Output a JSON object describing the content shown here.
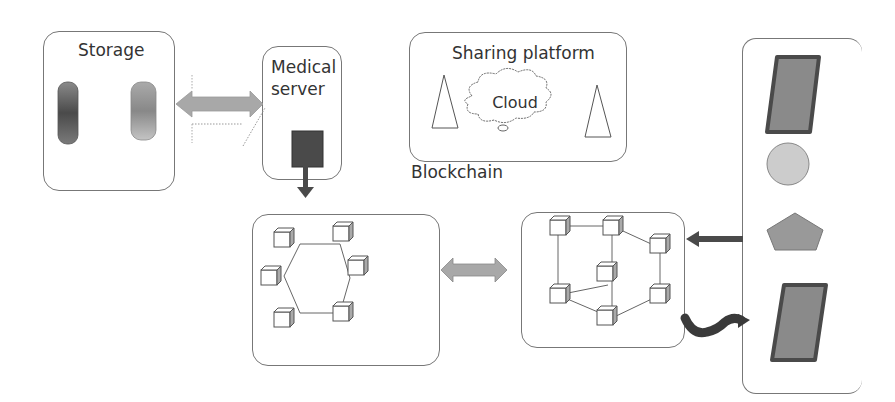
{
  "diagram": {
    "storage": {
      "title": "Storage"
    },
    "medical_server": {
      "title_line1": "Medical",
      "title_line2": "server"
    },
    "sharing_platform": {
      "title": "Sharing platform",
      "cloud_label": "Cloud"
    },
    "blockchain": {
      "label": "Blockchain"
    },
    "colors": {
      "box_border": "#777777",
      "arrow_gray": "#a8a8a8",
      "dark_gray": "#4a4a4a",
      "mid_gray": "#8a8a8a",
      "light_gray": "#cccccc"
    },
    "devices": [
      "tablet-top",
      "circle",
      "pentagon",
      "tablet-bottom"
    ],
    "networks": [
      {
        "name": "hexagon-ring-network",
        "nodes": 6
      },
      {
        "name": "mesh-network",
        "nodes": 7
      }
    ]
  }
}
